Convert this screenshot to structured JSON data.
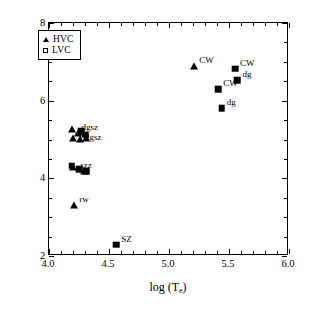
{
  "chart_data": {
    "type": "scatter",
    "title": "",
    "xlabel": "log (T_e)",
    "ylabel": "log (n_e)",
    "xlim": [
      4.0,
      6.0
    ],
    "ylim": [
      2,
      8
    ],
    "xticks": [
      "4.0",
      "4.5",
      "5.0",
      "5.5",
      "6.0"
    ],
    "xtick_values": [
      4.0,
      4.5,
      5.0,
      5.5,
      6.0
    ],
    "yticks": [
      "2",
      "4",
      "6",
      "8"
    ],
    "ytick_values": [
      2,
      4,
      6,
      8
    ],
    "grid": false,
    "legend_position": "upper-left",
    "legend": [
      {
        "label": "HVC",
        "marker": "triangle"
      },
      {
        "label": "LVC",
        "marker": "square"
      }
    ],
    "series": [
      {
        "name": "HVC",
        "marker": "triangle",
        "points": [
          {
            "x": 4.19,
            "y": 5.26,
            "label": ""
          },
          {
            "x": 4.24,
            "y": 5.18,
            "label": ""
          },
          {
            "x": 4.2,
            "y": 5.05,
            "label": ""
          },
          {
            "x": 4.26,
            "y": 5.02,
            "label": ""
          },
          {
            "x": 4.31,
            "y": 5.04,
            "label": ""
          },
          {
            "x": 4.2,
            "y": 4.3,
            "label": ""
          },
          {
            "x": 4.29,
            "y": 4.2,
            "label": ""
          },
          {
            "x": 4.21,
            "y": 3.31,
            "label": "rw"
          },
          {
            "x": 5.21,
            "y": 6.88,
            "label": "CW"
          }
        ]
      },
      {
        "name": "LVC",
        "marker": "square",
        "points": [
          {
            "x": 4.27,
            "y": 5.22,
            "label": ""
          },
          {
            "x": 4.3,
            "y": 5.12,
            "label": ""
          },
          {
            "x": 4.19,
            "y": 4.33,
            "label": ""
          },
          {
            "x": 4.25,
            "y": 4.24,
            "label": ""
          },
          {
            "x": 4.31,
            "y": 4.19,
            "label": ""
          },
          {
            "x": 4.56,
            "y": 2.29,
            "label": "SZ"
          },
          {
            "x": 5.41,
            "y": 6.3,
            "label": "CW"
          },
          {
            "x": 5.55,
            "y": 6.82,
            "label": "CW"
          },
          {
            "x": 5.57,
            "y": 6.52,
            "label": "dg"
          },
          {
            "x": 5.44,
            "y": 5.81,
            "label": "dg"
          }
        ]
      }
    ],
    "cluster_labels": [
      {
        "text": "dgsz",
        "x": 4.27,
        "y": 5.42
      },
      {
        "text": "dgsz",
        "x": 4.3,
        "y": 5.18
      },
      {
        "text": "szz",
        "x": 4.26,
        "y": 4.45
      }
    ]
  }
}
